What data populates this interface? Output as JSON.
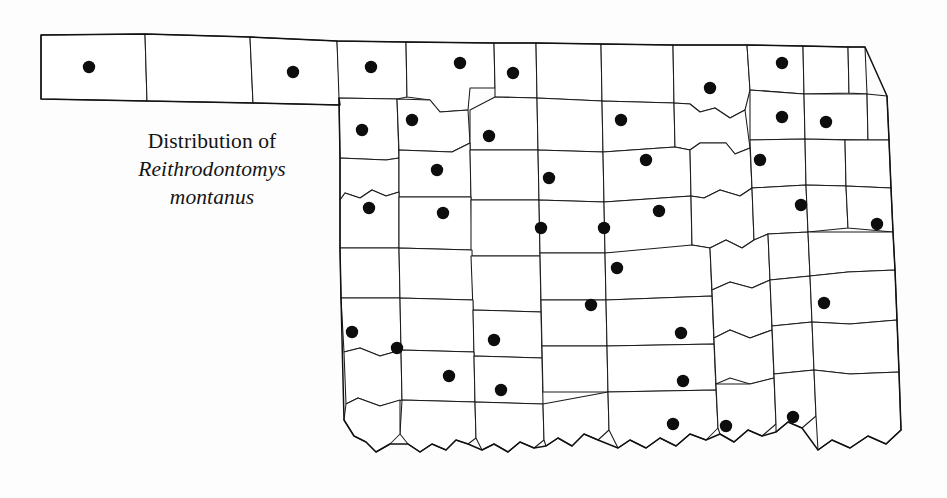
{
  "figure": {
    "type": "species-distribution-map",
    "region": "Oklahoma",
    "caption_line1": "Distribution of",
    "caption_line2": "Reithrodontomys",
    "caption_line3": "montanus",
    "dot_color": "#0d0d0d",
    "outline_color": "#1b1b1b",
    "background_color": "#ffffff",
    "dot_radius": 6.2,
    "record_count": 43
  },
  "chart_data": {
    "type": "scatter",
    "title": "Distribution of Reithrodontomys montanus",
    "xlabel": "",
    "ylabel": "",
    "legend": [],
    "grid": false,
    "points": [
      {
        "label": "Cimarron",
        "x": 89,
        "y": 67
      },
      {
        "label": "Beaver",
        "x": 293,
        "y": 72
      },
      {
        "label": "Harper",
        "x": 371,
        "y": 67
      },
      {
        "label": "Woods",
        "x": 460,
        "y": 63
      },
      {
        "label": "Alfalfa",
        "x": 513,
        "y": 73
      },
      {
        "label": "Kay",
        "x": 710,
        "y": 88
      },
      {
        "label": "Osage-north",
        "x": 782,
        "y": 63
      },
      {
        "label": "Ellis",
        "x": 362,
        "y": 130
      },
      {
        "label": "Woodward",
        "x": 412,
        "y": 120
      },
      {
        "label": "Major",
        "x": 489,
        "y": 136
      },
      {
        "label": "Noble",
        "x": 621,
        "y": 120
      },
      {
        "label": "Nowata",
        "x": 782,
        "y": 117
      },
      {
        "label": "Craig",
        "x": 826,
        "y": 122
      },
      {
        "label": "Dewey",
        "x": 437,
        "y": 170
      },
      {
        "label": "Kingfisher",
        "x": 549,
        "y": 178
      },
      {
        "label": "Payne",
        "x": 646,
        "y": 160
      },
      {
        "label": "Tulsa",
        "x": 760,
        "y": 160
      },
      {
        "label": "Roger Mills",
        "x": 369,
        "y": 208
      },
      {
        "label": "Custer",
        "x": 443,
        "y": 213
      },
      {
        "label": "Canadian",
        "x": 541,
        "y": 228
      },
      {
        "label": "Logan",
        "x": 604,
        "y": 228
      },
      {
        "label": "Creek",
        "x": 659,
        "y": 211
      },
      {
        "label": "Wagoner",
        "x": 801,
        "y": 205
      },
      {
        "label": "Sequoyah",
        "x": 877,
        "y": 224
      },
      {
        "label": "Cleveland",
        "x": 617,
        "y": 268
      },
      {
        "label": "Pottawatomie",
        "x": 591,
        "y": 305
      },
      {
        "label": "Latimer",
        "x": 824,
        "y": 303
      },
      {
        "label": "Harmon",
        "x": 352,
        "y": 332
      },
      {
        "label": "Caddo",
        "x": 494,
        "y": 340
      },
      {
        "label": "Garvin",
        "x": 681,
        "y": 333
      },
      {
        "label": "Jackson",
        "x": 397,
        "y": 348
      },
      {
        "label": "Tillman",
        "x": 449,
        "y": 376
      },
      {
        "label": "Cotton",
        "x": 501,
        "y": 390
      },
      {
        "label": "Carter",
        "x": 683,
        "y": 381
      },
      {
        "label": "Love",
        "x": 673,
        "y": 424
      },
      {
        "label": "Bryan",
        "x": 726,
        "y": 426
      },
      {
        "label": "Choctaw",
        "x": 793,
        "y": 417
      }
    ],
    "xlim": [
      0,
      947
    ],
    "ylim": [
      498,
      0
    ]
  }
}
